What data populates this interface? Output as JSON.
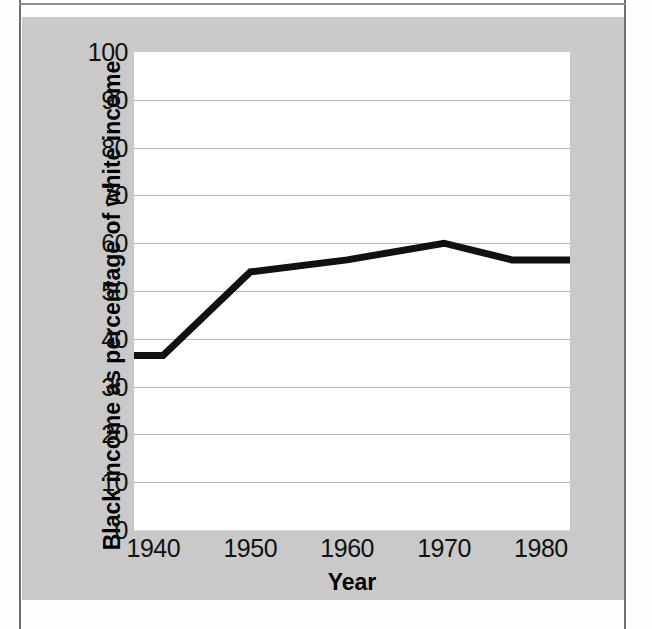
{
  "chart_data": {
    "type": "line",
    "title": "",
    "xlabel": "Year",
    "ylabel": "Black income as  percentage of white income",
    "xlim": [
      1938,
      1983
    ],
    "ylim": [
      0,
      100
    ],
    "grid": true,
    "legend": "none",
    "x_ticks": [
      "1940",
      "1950",
      "1960",
      "1970",
      "1980"
    ],
    "x_tick_values": [
      1940,
      1950,
      1960,
      1970,
      1980
    ],
    "y_ticks": [
      "0",
      "10",
      "20",
      "30",
      "40",
      "50",
      "60",
      "70",
      "80",
      "90",
      "100"
    ],
    "y_tick_values": [
      0,
      10,
      20,
      30,
      40,
      50,
      60,
      70,
      80,
      90,
      100
    ],
    "series": [
      {
        "name": "Black income as percentage of white income",
        "color": "#111111",
        "x": [
          1938,
          1941,
          1950,
          1960,
          1970,
          1977,
          1983
        ],
        "values": [
          36.5,
          36.5,
          54,
          56.5,
          60,
          56.5,
          56.5
        ]
      }
    ]
  },
  "axes": {
    "x_title": "Year",
    "y_title": "Black income as  percentage of white income"
  },
  "colors": {
    "panel_background": "#c9c9c9",
    "plot_background": "#ffffff",
    "gridline": "#b9b9b9",
    "line": "#111111",
    "text": "#111111"
  }
}
